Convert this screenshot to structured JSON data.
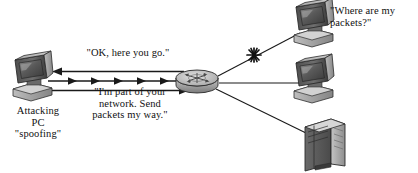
{
  "diagram": {
    "background_color": "#ffffff",
    "line_color": "#1a1a1a",
    "labels": {
      "router_reply": "\"OK, here you go.\"",
      "spoof_claim": "\"I'm part of your\nnetwork. Send\npackets my way.\"",
      "attacker": "Attacking\nPC\n\"spoofing\"",
      "victim_question": "\"Where are my\npackets?\""
    },
    "nodes": [
      {
        "id": "attacking-pc",
        "kind": "desktop-computer",
        "label": "Attacking PC \"spoofing\"",
        "x": 32,
        "y": 78
      },
      {
        "id": "router",
        "kind": "router",
        "label": "",
        "x": 196,
        "y": 79
      },
      {
        "id": "victim-computer-top",
        "kind": "desktop-computer",
        "label": "\"Where are my packets?\"",
        "x": 311,
        "y": 24
      },
      {
        "id": "computer-middle",
        "kind": "desktop-computer",
        "label": "",
        "x": 311,
        "y": 80
      },
      {
        "id": "server-bottom",
        "kind": "server-tower",
        "label": "",
        "x": 320,
        "y": 140
      }
    ],
    "links": [
      {
        "id": "router-to-attacker-reply",
        "from": "router",
        "to": "attacking-pc",
        "style": "arrow-left",
        "label": "\"OK, here you go.\""
      },
      {
        "id": "attacker-packet-stream",
        "from": "attacking-pc",
        "to": "router",
        "style": "multi-arrow-right",
        "arrow_count": 6,
        "label": ""
      },
      {
        "id": "attacker-to-router-claim",
        "from": "attacking-pc",
        "to": "router",
        "style": "arrow-right",
        "label": "\"I'm part of your network. Send packets my way.\""
      },
      {
        "id": "router-to-victim-top",
        "from": "router",
        "to": "victim-computer-top",
        "style": "plain",
        "broken": true
      },
      {
        "id": "router-to-computer-middle",
        "from": "router",
        "to": "computer-middle",
        "style": "plain",
        "broken": false
      },
      {
        "id": "router-to-server-bottom",
        "from": "router",
        "to": "server-bottom",
        "style": "plain",
        "broken": false
      }
    ],
    "markers": [
      {
        "id": "broken-link-starburst",
        "kind": "starburst-icon",
        "x": 254,
        "y": 55,
        "on_link": "router-to-victim-top"
      }
    ]
  }
}
